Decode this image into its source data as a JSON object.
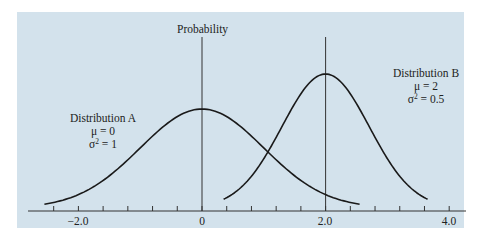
{
  "chart_data": {
    "type": "line",
    "title": "",
    "xlabel": "",
    "ylabel": "Probability",
    "xlim": [
      -2.6,
      4.2
    ],
    "x_tick_labels": [
      "-2.0",
      "0",
      "2.0",
      "4.0"
    ],
    "x_tick_values": [
      -2.0,
      0,
      2.0,
      4.0
    ],
    "minor_tick_step": 0.4,
    "grid": false,
    "vertical_reference_lines": [
      0,
      2.0
    ],
    "series": [
      {
        "name": "Distribution A",
        "distribution": "normal",
        "mean": 0,
        "variance": 1,
        "x_range": [
          -2.55,
          2.55
        ],
        "peak_x": 0
      },
      {
        "name": "Distribution B",
        "distribution": "normal",
        "mean": 2,
        "variance": 0.5,
        "x_range": [
          0.35,
          3.65
        ],
        "peak_x": 2
      }
    ],
    "annotations": [
      {
        "text": "Distribution A",
        "lines": [
          "Distribution A",
          "μ = 0",
          "σ² = 1"
        ]
      },
      {
        "text": "Distribution B",
        "lines": [
          "Distribution B",
          "μ = 2",
          "σ² = 0.5"
        ]
      }
    ]
  },
  "labels": {
    "y_axis": "Probability",
    "dist_a_title": "Distribution A",
    "dist_a_mu": "μ = 0",
    "dist_a_sigma_base": "σ",
    "dist_a_sigma_exp": "2",
    "dist_a_sigma_val": " = 1",
    "dist_b_title": "Distribution B",
    "dist_b_mu": "μ = 2",
    "dist_b_sigma_base": "σ",
    "dist_b_sigma_exp": "2",
    "dist_b_sigma_val": " = 0.5",
    "tick_m2": "−2.0",
    "tick_0": "0",
    "tick_2": "2.0",
    "tick_4": "4.0"
  },
  "colors": {
    "panel_background": "#d3e2ec",
    "line": "#1a1a1a",
    "axis": "#333333"
  }
}
